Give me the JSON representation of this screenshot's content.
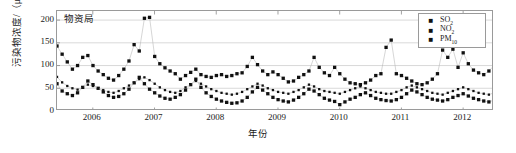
{
  "chart_data": {
    "type": "scatter",
    "title": "物资局",
    "xlabel": "年份",
    "ylabel": "污染物浓度/（μg/m³）",
    "ylim": [
      0,
      220
    ],
    "yticks": [
      0,
      50,
      100,
      150,
      200
    ],
    "xlim": [
      2005.42,
      2012.5
    ],
    "xticks": [
      2006,
      2007,
      2008,
      2009,
      2010,
      2011,
      2012
    ],
    "xtick_labels": [
      "2006",
      "2007",
      "2008",
      "2009",
      "2010",
      "2011",
      "2012"
    ],
    "grid": "horizontal",
    "legend_position": "top-right",
    "marker": "filled-square",
    "connected": true,
    "x_start": 2005.42,
    "x_step": 0.0833,
    "series": [
      {
        "name": "SO2",
        "label_html": "SO<sub>2</sub>",
        "color": "#111111",
        "values": [
          60,
          44,
          38,
          34,
          40,
          52,
          66,
          58,
          50,
          42,
          34,
          30,
          32,
          38,
          48,
          62,
          74,
          60,
          48,
          40,
          33,
          28,
          26,
          30,
          36,
          46,
          58,
          70,
          52,
          40,
          32,
          26,
          22,
          19,
          17,
          18,
          22,
          30,
          42,
          52,
          46,
          38,
          30,
          25,
          22,
          20,
          24,
          30,
          38,
          48,
          44,
          36,
          28,
          24,
          21,
          14,
          20,
          26,
          30,
          36,
          40,
          34,
          28,
          25,
          23,
          22,
          25,
          30,
          38,
          46,
          42,
          36,
          30,
          26,
          24,
          22,
          25,
          30,
          34,
          38,
          33,
          28,
          25,
          22,
          20,
          24,
          28,
          34,
          30,
          25,
          22,
          18,
          16,
          19,
          23,
          22
        ]
      },
      {
        "name": "NO2",
        "label_html": "NO<sub>2</sub>",
        "color": "#111111",
        "values": [
          75,
          63,
          55,
          50,
          47,
          52,
          58,
          55,
          50,
          46,
          42,
          40,
          44,
          50,
          56,
          62,
          70,
          74,
          68,
          60,
          52,
          46,
          42,
          40,
          44,
          52,
          58,
          66,
          60,
          54,
          48,
          44,
          40,
          38,
          36,
          38,
          42,
          48,
          54,
          60,
          56,
          50,
          46,
          42,
          40,
          38,
          42,
          46,
          52,
          58,
          54,
          48,
          44,
          42,
          40,
          38,
          42,
          46,
          50,
          54,
          50,
          46,
          42,
          40,
          38,
          38,
          42,
          46,
          52,
          56,
          52,
          48,
          44,
          40,
          38,
          36,
          40,
          44,
          48,
          52,
          48,
          44,
          40,
          38,
          36,
          40,
          44,
          48,
          44,
          40,
          36,
          32,
          30,
          34,
          38,
          36
        ]
      },
      {
        "name": "PM10",
        "label_html": "PM<sub>10</sub>",
        "color": "#111111",
        "values": [
          143,
          125,
          108,
          92,
          100,
          118,
          122,
          100,
          88,
          80,
          72,
          68,
          78,
          92,
          110,
          146,
          132,
          204,
          206,
          120,
          104,
          95,
          88,
          82,
          70,
          78,
          85,
          92,
          80,
          76,
          74,
          78,
          80,
          76,
          78,
          82,
          84,
          98,
          118,
          102,
          88,
          80,
          86,
          80,
          72,
          64,
          66,
          74,
          80,
          88,
          118,
          96,
          84,
          78,
          96,
          82,
          70,
          62,
          60,
          58,
          62,
          68,
          78,
          82,
          140,
          156,
          82,
          78,
          72,
          66,
          60,
          58,
          62,
          70,
          82,
          134,
          118,
          136,
          96,
          128,
          104,
          90,
          84,
          80,
          88,
          100,
          96,
          150,
          152,
          118,
          102,
          96,
          88,
          92,
          108,
          178
        ]
      }
    ]
  },
  "legend": {
    "items": [
      {
        "marker": "square-marker",
        "label": "SO2"
      },
      {
        "marker": "square-marker",
        "label": "NO2"
      },
      {
        "marker": "square-marker",
        "label": "PM10"
      }
    ]
  }
}
